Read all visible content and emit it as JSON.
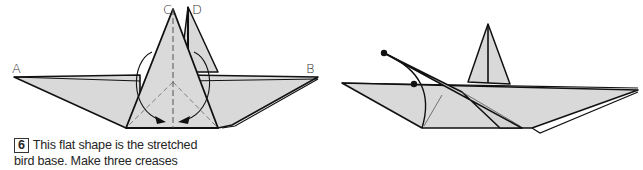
{
  "colors": {
    "paper": "#d9d9d9",
    "line": "#111111",
    "background": "#ffffff"
  },
  "step6": {
    "number": "6",
    "caption_line1": "This flat shape is the stretched",
    "caption_line2": "bird base. Make three creases",
    "labels": {
      "a": "A",
      "b": "B",
      "c": "C",
      "d": "D"
    },
    "arrows": [
      "curved-arrow-left-to-center",
      "curved-arrow-right-to-center"
    ]
  },
  "step7": {
    "number": "7",
    "caption_line1": ". . . like this. Collapse C over to",
    "caption_line2": "the left, flattening it dot to dot.",
    "labels": {
      "a": "A",
      "b": "B",
      "c": "C",
      "d": "D"
    },
    "arrows": [
      "straight-arrow-c-to-dot"
    ]
  }
}
